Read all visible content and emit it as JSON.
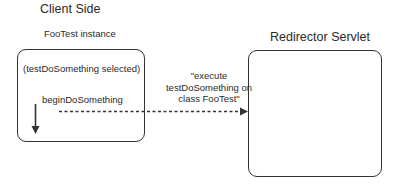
{
  "client": {
    "heading": "Client Side",
    "instance_label": "FooTest instance",
    "selected_text": "(testDoSomething selected)",
    "method_label": "beginDoSomething"
  },
  "server": {
    "heading": "Redirector Servlet"
  },
  "message": {
    "text": "\"execute testDoSomething on class FooTest\""
  },
  "icons": {
    "down_arrow": "arrow-down-icon",
    "dashed_arrow": "dashed-arrow-right-icon"
  },
  "colors": {
    "stroke": "#333333",
    "text": "#2a2a2a",
    "background": "#ffffff"
  }
}
